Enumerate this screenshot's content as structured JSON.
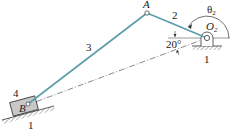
{
  "figure": {
    "labels": {
      "joint_a": "A",
      "joint_o2": "O",
      "joint_o2_sub": "2",
      "joint_b": "B",
      "link_2": "2",
      "link_3": "3",
      "link_4": "4",
      "ground_right": "1",
      "ground_left": "1",
      "angle_theta": "θ",
      "angle_theta_sub": "2",
      "angle_offset": "20°"
    },
    "colors": {
      "link": "#5b9cad",
      "line": "#333333",
      "slider_fill": "#c8c8c8"
    }
  }
}
